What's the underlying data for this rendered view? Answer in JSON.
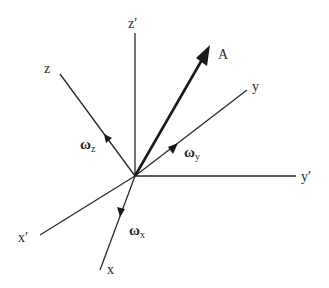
{
  "diagram": {
    "title": "",
    "origin": {
      "x": 135,
      "y": 176
    },
    "colors": {
      "line": "#2a2a2a",
      "vector": "#1a1a1a",
      "background": "#ffffff"
    },
    "axes": [
      {
        "id": "z_prime",
        "label": "z′",
        "end": {
          "x": 135,
          "y": 33
        },
        "label_pos": {
          "x": 128,
          "y": 28
        }
      },
      {
        "id": "z",
        "label": "z",
        "end": {
          "x": 60,
          "y": 74
        },
        "label_pos": {
          "x": 44,
          "y": 73
        }
      },
      {
        "id": "y",
        "label": "y",
        "end": {
          "x": 247,
          "y": 90
        },
        "label_pos": {
          "x": 252,
          "y": 91
        }
      },
      {
        "id": "y_prime",
        "label": "y′",
        "end": {
          "x": 296,
          "y": 176
        },
        "label_pos": {
          "x": 301,
          "y": 181
        }
      },
      {
        "id": "x_prime",
        "label": "x′",
        "end": {
          "x": 40,
          "y": 235
        },
        "label_pos": {
          "x": 18,
          "y": 242
        }
      },
      {
        "id": "x",
        "label": "x",
        "end": {
          "x": 100,
          "y": 270
        },
        "label_pos": {
          "x": 107,
          "y": 274
        }
      }
    ],
    "vector": {
      "id": "A",
      "label": "A",
      "end": {
        "x": 209,
        "y": 47
      },
      "label_pos": {
        "x": 218,
        "y": 59
      }
    },
    "angular_velocities": [
      {
        "id": "omega_z",
        "symbol": "ω",
        "subscript": "z",
        "on_axis": "z",
        "label_pos": {
          "x": 80,
          "y": 149
        }
      },
      {
        "id": "omega_y",
        "symbol": "ω",
        "subscript": "y",
        "on_axis": "y",
        "label_pos": {
          "x": 184,
          "y": 157
        }
      },
      {
        "id": "omega_x",
        "symbol": "ω",
        "subscript": "x",
        "on_axis": "x",
        "label_pos": {
          "x": 129,
          "y": 235
        }
      }
    ]
  }
}
